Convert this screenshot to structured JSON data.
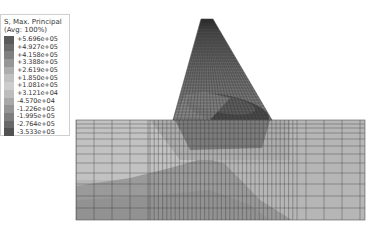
{
  "legend": {
    "title_line1": "S, Max. Principal",
    "title_line2": "(Avg: 100%)",
    "entries": [
      {
        "value": "+5.696e+05",
        "color": "#5a5a5a"
      },
      {
        "value": "+4.927e+05",
        "color": "#6b6b6b"
      },
      {
        "value": "+4.158e+05",
        "color": "#808080"
      },
      {
        "value": "+3.388e+05",
        "color": "#969696"
      },
      {
        "value": "+2.619e+05",
        "color": "#adadad"
      },
      {
        "value": "+1.850e+05",
        "color": "#c0c0c0"
      },
      {
        "value": "+1.081e+05",
        "color": "#cdcdcd"
      },
      {
        "value": "+3.121e+04",
        "color": "#bdbdbd"
      },
      {
        "value": "-4.570e+04",
        "color": "#a8a8a8"
      },
      {
        "value": "-1.226e+05",
        "color": "#949494"
      },
      {
        "value": "-1.995e+05",
        "color": "#7e7e7e"
      },
      {
        "value": "-2.764e+05",
        "color": "#686868"
      },
      {
        "value": "-3.533e+05",
        "color": "#525252"
      }
    ]
  },
  "model": {
    "description": "Gravity dam on foundation block, FE mesh contour plot",
    "dam": {
      "top_left": [
        201,
        19
      ],
      "top_right": [
        213,
        19
      ],
      "base_left": [
        173,
        120
      ],
      "base_right": [
        272,
        120
      ]
    },
    "foundation": {
      "x": 76,
      "y": 120,
      "width": 289,
      "height": 100
    },
    "colors": {
      "foundation_light": "#b4b4b4",
      "foundation_dark": "#8e8e8e",
      "dam_body": "#7a7a7a",
      "dam_dark": "#3e3e3e",
      "mesh_line": "#333333"
    }
  }
}
